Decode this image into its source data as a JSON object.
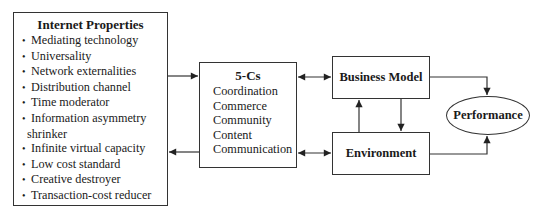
{
  "diagram": {
    "internet_properties": {
      "title": "Internet Properties",
      "bullet": "•",
      "items": [
        {
          "label": "Mediating technology"
        },
        {
          "label": "Universality"
        },
        {
          "label": "Network externalities"
        },
        {
          "label": "Distribution channel"
        },
        {
          "label": "Time moderator"
        },
        {
          "label": "Information asymmetry",
          "continuation": "shrinker"
        },
        {
          "label": "Infinite virtual capacity"
        },
        {
          "label": "Low cost standard"
        },
        {
          "label": "Creative destroyer"
        },
        {
          "label": "Transaction-cost reducer"
        }
      ]
    },
    "five_cs": {
      "title": "5-Cs",
      "items": [
        "Coordination",
        "Commerce",
        "Community",
        "Content",
        "Communication"
      ]
    },
    "business_model": {
      "label": "Business Model"
    },
    "environment": {
      "label": "Environment"
    },
    "performance": {
      "label": "Performance"
    },
    "edges": [
      {
        "from": "Internet Properties",
        "to": "5-Cs",
        "type": "directed"
      },
      {
        "from": "5-Cs",
        "to": "Internet Properties",
        "type": "directed"
      },
      {
        "from": "5-Cs",
        "to": "Business Model",
        "type": "bidirectional"
      },
      {
        "from": "5-Cs",
        "to": "Environment",
        "type": "bidirectional"
      },
      {
        "from": "Environment",
        "to": "Business Model",
        "type": "directed"
      },
      {
        "from": "Business Model",
        "to": "Environment",
        "type": "directed"
      },
      {
        "from": "Business Model",
        "to": "Performance",
        "type": "directed"
      },
      {
        "from": "Environment",
        "to": "Performance",
        "type": "directed"
      }
    ]
  }
}
